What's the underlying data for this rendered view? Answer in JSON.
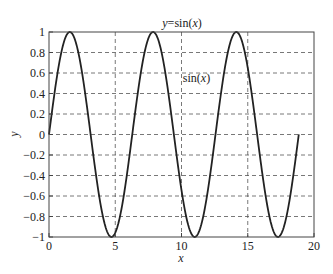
{
  "chart_data": {
    "type": "line",
    "title": "y=sin(x)",
    "title_parts": {
      "pre": "y",
      "mid": "=sin(",
      "var": "x",
      "post": ")"
    },
    "xlabel": "x",
    "ylabel": "y",
    "xlim": [
      0,
      20
    ],
    "ylim": [
      -1,
      1
    ],
    "xticks": [
      0,
      5,
      10,
      15,
      20
    ],
    "xtick_labels": [
      "0",
      "5",
      "10",
      "15",
      "20"
    ],
    "yticks": [
      -1,
      -0.8,
      -0.6,
      -0.4,
      -0.2,
      0,
      0.2,
      0.4,
      0.6,
      0.8,
      1
    ],
    "ytick_labels": [
      "−1",
      "−0.8",
      "−0.6",
      "−0.4",
      "−0.2",
      "0",
      "0.2",
      "0.4",
      "0.6",
      "0.8",
      "1"
    ],
    "grid": true,
    "grid_style": "dashed",
    "annotation": {
      "text": "sin(x)",
      "text_parts": {
        "pre": "sin(",
        "var": "x",
        "post": ")"
      },
      "x": 10.1,
      "y": 0.55
    },
    "series": [
      {
        "name": "sin(x)",
        "function": "sin(x)",
        "x_range": [
          0,
          18.85
        ],
        "x": [
          0,
          1.5708,
          3.1416,
          4.7124,
          6.2832,
          7.854,
          9.4248,
          10.9956,
          12.5664,
          14.1372,
          15.708,
          17.2788,
          18.8496
        ],
        "y": [
          0,
          1,
          0,
          -1,
          0,
          1,
          0,
          -1,
          0,
          1,
          0,
          -1,
          0
        ],
        "color": "#222222"
      }
    ]
  },
  "colors": {
    "line": "#222222",
    "grid": "#555555",
    "axes": "#444444",
    "background": "#ffffff"
  }
}
